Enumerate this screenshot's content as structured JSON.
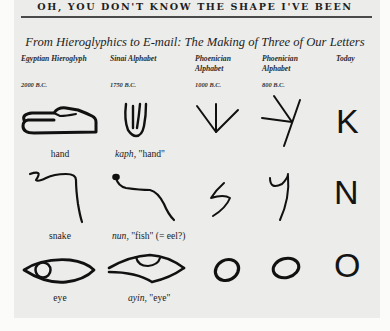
{
  "running_head": "OH, YOU DON'T KNOW THE SHAPE I'VE BEEN",
  "figure": {
    "title": "From Hieroglyphics to E-mail: The Making of Three of Our Letters",
    "columns": [
      {
        "heading": "Egyptian Hieroglyph",
        "date": "2000 B.C."
      },
      {
        "heading": "Sinai Alphabet",
        "date": "1750 B.C."
      },
      {
        "heading": "Phoenician Alphabet",
        "date": "1000 B.C."
      },
      {
        "heading": "Phoenician Alphabet",
        "date": "800 B.C."
      },
      {
        "heading": "Today",
        "date": ""
      }
    ],
    "rows": [
      {
        "hieroglyph_icon": "hand-hieroglyph-icon",
        "hieroglyph_caption": "hand",
        "sinai_icon": "kaph-sinai-icon",
        "sinai_name": "kaph,",
        "sinai_meaning": "\"hand\"",
        "phoenician_1000_icon": "kaph-phoenician-early-icon",
        "phoenician_800_icon": "kaph-phoenician-late-icon",
        "today": "K"
      },
      {
        "hieroglyph_icon": "snake-hieroglyph-icon",
        "hieroglyph_caption": "snake",
        "sinai_icon": "nun-sinai-icon",
        "sinai_name": "nun,",
        "sinai_meaning": "\"fish\" (= eel?)",
        "phoenician_1000_icon": "nun-phoenician-early-icon",
        "phoenician_800_icon": "nun-phoenician-late-icon",
        "today": "N"
      },
      {
        "hieroglyph_icon": "eye-hieroglyph-icon",
        "hieroglyph_caption": "eye",
        "sinai_icon": "ayin-sinai-icon",
        "sinai_name": "ayin,",
        "sinai_meaning": "\"eye\"",
        "phoenician_1000_icon": "ayin-phoenician-early-icon",
        "phoenician_800_icon": "ayin-phoenician-late-icon",
        "today": "O"
      }
    ]
  }
}
